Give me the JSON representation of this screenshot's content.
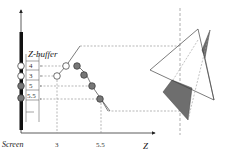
{
  "diagram": {
    "title": "Z-buffer",
    "axis_labels": {
      "vertical": "Screen",
      "horizontal": "Z"
    },
    "z_ticks": [
      "3",
      "5.5"
    ],
    "zbuffer_values": [
      "4",
      "3",
      "5",
      "5.5"
    ],
    "colors": {
      "stroke": "#444444",
      "dashed": "#888888",
      "filled_dot": "#777777",
      "shaded_poly": "#6e6e6e",
      "screen_bar": "#111111"
    }
  }
}
